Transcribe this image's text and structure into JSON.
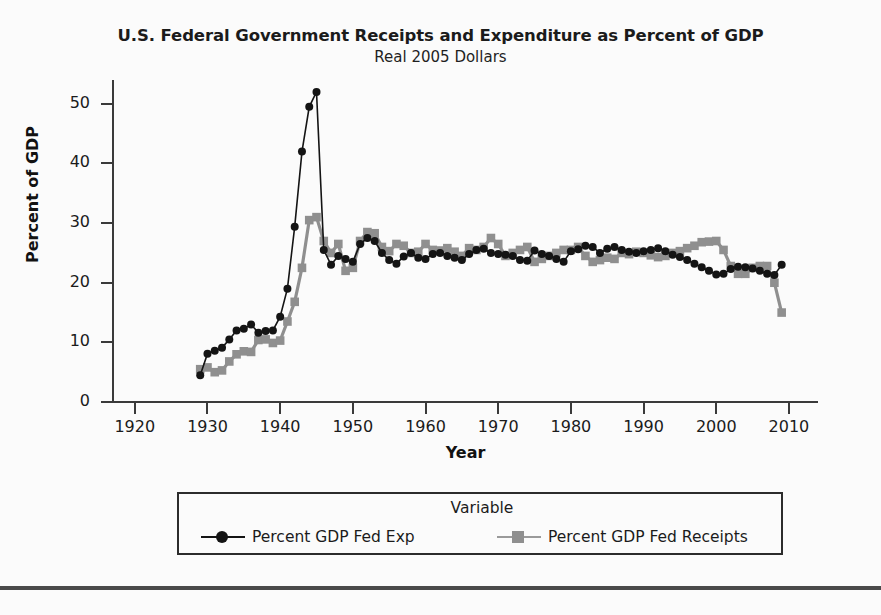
{
  "chart_data": {
    "type": "line",
    "title": "U.S. Federal Government Receipts and Expenditure as Percent of GDP",
    "subtitle": "Real 2005 Dollars",
    "xlabel": "Year",
    "ylabel": "Percent of GDP",
    "xlim": [
      1917,
      2014
    ],
    "ylim": [
      0,
      54
    ],
    "xticks": [
      1920,
      1930,
      1940,
      1950,
      1960,
      1970,
      1980,
      1990,
      2000,
      2010
    ],
    "yticks": [
      0,
      10,
      20,
      30,
      40,
      50
    ],
    "grid": false,
    "legend_position": "bottom",
    "legend_title": "Variable",
    "x": [
      1929,
      1930,
      1931,
      1932,
      1933,
      1934,
      1935,
      1936,
      1937,
      1938,
      1939,
      1940,
      1941,
      1942,
      1943,
      1944,
      1945,
      1946,
      1947,
      1948,
      1949,
      1950,
      1951,
      1952,
      1953,
      1954,
      1955,
      1956,
      1957,
      1958,
      1959,
      1960,
      1961,
      1962,
      1963,
      1964,
      1965,
      1966,
      1967,
      1968,
      1969,
      1970,
      1971,
      1972,
      1973,
      1974,
      1975,
      1976,
      1977,
      1978,
      1979,
      1980,
      1981,
      1982,
      1983,
      1984,
      1985,
      1986,
      1987,
      1988,
      1989,
      1990,
      1991,
      1992,
      1993,
      1994,
      1995,
      1996,
      1997,
      1998,
      1999,
      2000,
      2001,
      2002,
      2003,
      2004,
      2005,
      2006,
      2007,
      2008,
      2009
    ],
    "series": [
      {
        "name": "Percent GDP Fed Exp",
        "marker": "circle",
        "color": "#141414",
        "values": [
          4.5,
          8.1,
          8.6,
          9.1,
          10.5,
          12.0,
          12.3,
          13.0,
          11.6,
          11.9,
          12.0,
          14.3,
          19.0,
          29.4,
          42.0,
          49.5,
          52.0,
          25.5,
          23.0,
          24.5,
          24.0,
          23.5,
          26.5,
          27.5,
          27.0,
          25.0,
          23.8,
          23.2,
          24.4,
          25.0,
          24.2,
          24.0,
          24.8,
          25.0,
          24.5,
          24.2,
          23.8,
          24.8,
          25.5,
          25.7,
          25.0,
          24.8,
          24.7,
          24.5,
          23.8,
          23.7,
          25.4,
          24.8,
          24.5,
          24.0,
          23.5,
          25.3,
          25.6,
          26.2,
          26.0,
          25.0,
          25.7,
          26.0,
          25.5,
          25.2,
          25.0,
          25.3,
          25.5,
          25.8,
          25.3,
          24.7,
          24.3,
          23.8,
          23.2,
          22.6,
          22.0,
          21.4,
          21.5,
          22.3,
          22.7,
          22.6,
          22.4,
          22.0,
          21.5,
          21.3,
          23.0
        ]
      },
      {
        "name": "Percent GDP Fed Receipts",
        "marker": "square",
        "color": "#8f8f8f",
        "values": [
          5.5,
          5.8,
          5.0,
          5.3,
          6.8,
          8.0,
          8.5,
          8.4,
          10.4,
          10.5,
          9.9,
          10.3,
          13.5,
          16.8,
          22.5,
          30.5,
          31.0,
          27.0,
          25.0,
          26.5,
          22.0,
          22.5,
          27.0,
          28.5,
          28.3,
          26.0,
          25.3,
          26.5,
          26.2,
          25.0,
          25.2,
          26.5,
          25.5,
          25.4,
          25.8,
          25.2,
          24.5,
          25.8,
          25.5,
          26.0,
          27.5,
          26.5,
          24.5,
          25.0,
          25.5,
          26.0,
          23.5,
          24.0,
          24.5,
          25.0,
          25.5,
          25.5,
          26.0,
          24.5,
          23.5,
          23.8,
          24.2,
          24.0,
          25.0,
          24.8,
          25.2,
          25.0,
          24.6,
          24.3,
          24.5,
          25.0,
          25.3,
          25.8,
          26.2,
          26.8,
          26.9,
          27.0,
          25.5,
          22.8,
          21.5,
          21.5,
          22.5,
          22.8,
          22.8,
          20.0,
          15.0
        ]
      }
    ]
  },
  "title": {
    "main": "U.S. Federal Government Receipts and Expenditure as Percent of GDP",
    "sub": "Real 2005 Dollars"
  },
  "axes": {
    "y_title": "Percent of GDP",
    "x_title": "Year",
    "y_labels": [
      "50",
      "40",
      "30",
      "20",
      "10",
      "0"
    ],
    "x_labels": [
      "1920",
      "1930",
      "1940",
      "1950",
      "1960",
      "1970",
      "1980",
      "1990",
      "2000",
      "2010"
    ]
  },
  "legend": {
    "title": "Variable",
    "entries": [
      {
        "label": "Percent GDP Fed Exp",
        "marker": "circle-marker",
        "color": "#141414"
      },
      {
        "label": "Percent GDP Fed Receipts",
        "marker": "square-marker",
        "color": "#8f8f8f"
      }
    ]
  },
  "colors": {
    "expenditure": "#141414",
    "receipts": "#8f8f8f",
    "axis": "#3a3a3a",
    "background": "#fbfbfb"
  }
}
